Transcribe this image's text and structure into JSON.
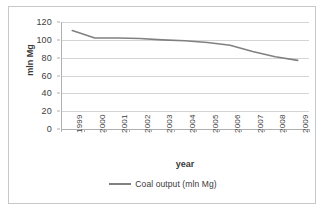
{
  "chart_data": {
    "type": "line",
    "title": "",
    "xlabel": "year",
    "ylabel": "mln Mg",
    "categories": [
      "1999",
      "2000",
      "2001",
      "2002",
      "2003",
      "2004",
      "2005",
      "2006",
      "2007",
      "2008",
      "2009"
    ],
    "series": [
      {
        "name": "Coal output (mln Mg)",
        "color": "#808080",
        "values": [
          110.5,
          102.0,
          102.0,
          101.5,
          100.0,
          99.0,
          97.0,
          94.0,
          87.0,
          81.0,
          77.0
        ]
      }
    ],
    "ylim": [
      0,
      120
    ],
    "y_ticks": [
      0,
      20,
      40,
      60,
      80,
      100,
      120
    ],
    "y_tick_labels": [
      "0",
      "20",
      "40",
      "60",
      "80",
      "100",
      "120"
    ],
    "grid": true,
    "grid_axis": "y",
    "legend_position": "bottom"
  },
  "legend": {
    "entries": [
      {
        "label": "Coal output (mln Mg)",
        "color": "#808080"
      }
    ]
  },
  "axes": {
    "x_title": "year",
    "y_title": "mln Mg"
  },
  "colors": {
    "series_line": "#808080",
    "gridline": "#d4d4d4",
    "axis_line": "#b0b0b0",
    "frame_border": "#c8c8c8",
    "tick_text": "#404040",
    "title_text": "#3a3a3a",
    "background": "#ffffff"
  }
}
